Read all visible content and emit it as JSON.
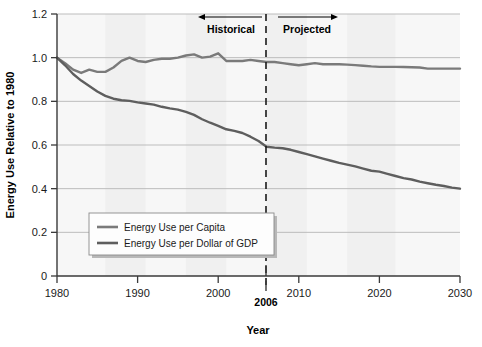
{
  "chart_data": {
    "type": "line",
    "title": "",
    "xlabel": "Year",
    "ylabel": "Energy Use Relative to 1980",
    "xlim": [
      1980,
      2030
    ],
    "ylim": [
      0,
      1.2
    ],
    "grid": "horizontal",
    "legend_position": "lower-left-inside",
    "x_ticks": [
      "1980",
      "1990",
      "2000",
      "2010",
      "2020",
      "2030"
    ],
    "x_tick_values": [
      1980,
      1990,
      2000,
      2010,
      2020,
      2030
    ],
    "y_ticks": [
      "0",
      "0.2",
      "0.4",
      "0.6",
      "0.8",
      "1.0",
      "1.2"
    ],
    "y_tick_values": [
      0,
      0.2,
      0.4,
      0.6,
      0.8,
      1.0,
      1.2
    ],
    "x": [
      1980,
      1981,
      1982,
      1983,
      1984,
      1985,
      1986,
      1987,
      1988,
      1989,
      1990,
      1991,
      1992,
      1993,
      1994,
      1995,
      1996,
      1997,
      1998,
      1999,
      2000,
      2001,
      2002,
      2003,
      2004,
      2005,
      2006,
      2007,
      2008,
      2009,
      2010,
      2011,
      2012,
      2013,
      2014,
      2015,
      2016,
      2017,
      2018,
      2019,
      2020,
      2021,
      2022,
      2023,
      2024,
      2025,
      2026,
      2027,
      2028,
      2029,
      2030
    ],
    "series": [
      {
        "name": "Energy Use per Capita",
        "color": "#7a7a7a",
        "values": [
          1.0,
          0.975,
          0.945,
          0.93,
          0.945,
          0.935,
          0.935,
          0.955,
          0.985,
          1.0,
          0.985,
          0.98,
          0.99,
          0.995,
          0.995,
          1.0,
          1.01,
          1.015,
          1.0,
          1.005,
          1.02,
          0.985,
          0.985,
          0.985,
          0.99,
          0.985,
          0.98,
          0.98,
          0.975,
          0.97,
          0.965,
          0.97,
          0.975,
          0.97,
          0.97,
          0.97,
          0.968,
          0.966,
          0.963,
          0.96,
          0.958,
          0.958,
          0.958,
          0.957,
          0.956,
          0.955,
          0.95,
          0.95,
          0.95,
          0.95,
          0.95
        ]
      },
      {
        "name": "Energy Use per Dollar of GDP",
        "color": "#5e5e5e",
        "values": [
          1.0,
          0.965,
          0.925,
          0.895,
          0.87,
          0.845,
          0.825,
          0.812,
          0.805,
          0.802,
          0.795,
          0.79,
          0.785,
          0.775,
          0.768,
          0.762,
          0.752,
          0.738,
          0.718,
          0.702,
          0.688,
          0.672,
          0.665,
          0.655,
          0.638,
          0.618,
          0.592,
          0.588,
          0.585,
          0.578,
          0.568,
          0.558,
          0.548,
          0.538,
          0.528,
          0.518,
          0.51,
          0.502,
          0.492,
          0.482,
          0.478,
          0.468,
          0.458,
          0.448,
          0.442,
          0.432,
          0.425,
          0.418,
          0.412,
          0.405,
          0.4
        ]
      }
    ],
    "annotations": [
      {
        "name": "divider-year",
        "label": "2006",
        "value": 2006,
        "style": "dashed-vertical"
      },
      {
        "name": "historical",
        "label": "Historical",
        "arrow": "left"
      },
      {
        "name": "projected",
        "label": "Projected",
        "arrow": "right"
      }
    ]
  },
  "legend": {
    "entries": [
      {
        "label": "Energy Use per Capita"
      },
      {
        "label": "Energy Use per Dollar of GDP"
      }
    ]
  },
  "colors": {
    "per_capita_line": "#7a7a7a",
    "per_gdp_line": "#5e5e5e",
    "axis": "#3a3a3a",
    "gridline": "#b6b6b6",
    "plot_background": "#f7f7f7",
    "band_shade": "#ededed",
    "legend_background": "#fdfdfd",
    "legend_border": "#8a8a8a",
    "text": "#111111"
  }
}
